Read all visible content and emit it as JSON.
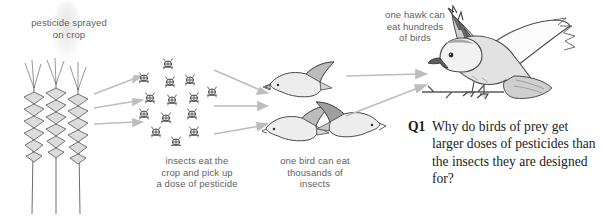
{
  "diagram": {
    "labels": {
      "spray": "pesticide sprayed\non crop",
      "insects": "insects eat the\ncrop and pick up\na dose of pesticide",
      "one_bird": "one bird can eat\nthousands of\ninsects",
      "one_hawk": "one hawk can\neat hundreds\nof birds"
    },
    "colors": {
      "label_text": "#5f5f5f",
      "arrow": "#b0b0b0",
      "outline": "#4a4a4a",
      "fill_light": "#ebebeb",
      "fill_mid": "#cfcfcf",
      "fill_dark": "#9a9a9a",
      "question_text": "#1c1c1c",
      "background": "#ffffff"
    },
    "stages": [
      {
        "name": "crop",
        "icon": "wheat-icon",
        "count": 3
      },
      {
        "name": "insects",
        "icon": "insect-icon",
        "count": 14
      },
      {
        "name": "birds",
        "icon": "bird-icon",
        "count": 3
      },
      {
        "name": "hawk",
        "icon": "hawk-icon",
        "count": 1
      }
    ],
    "arrow_groups": [
      {
        "name": "crop-to-insects",
        "count": 3
      },
      {
        "name": "insects-to-birds",
        "count": 3
      },
      {
        "name": "birds-to-hawk",
        "count": 2
      }
    ]
  },
  "question": {
    "number": "Q1",
    "text": "Why do birds of prey get larger doses of pesticides than the insects they are designed for?"
  }
}
